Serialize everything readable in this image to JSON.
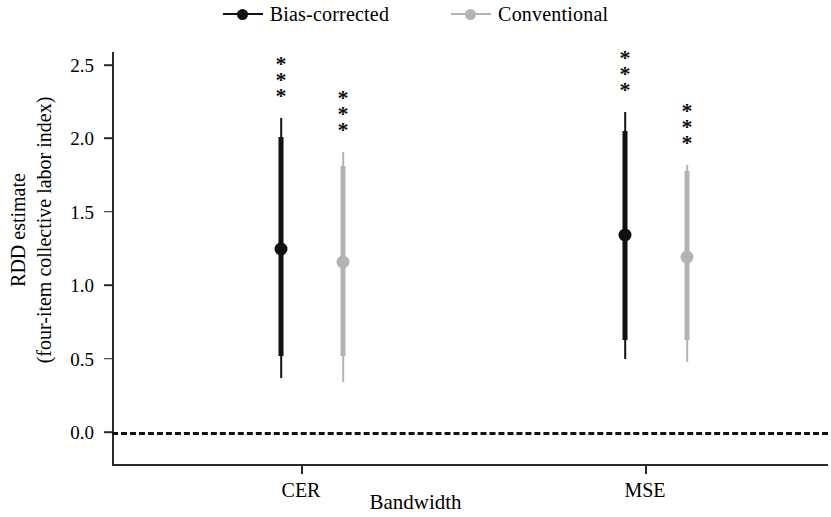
{
  "chart_data": {
    "type": "scatter",
    "title": "",
    "xlabel": "Bandwidth",
    "ylabel_line1": "RDD estimate",
    "ylabel_line2": "(four-item collective labor index)",
    "categories": [
      "CER",
      "MSE"
    ],
    "ylim": [
      -0.22,
      2.72
    ],
    "yticks": [
      "0.0",
      "0.5",
      "1.0",
      "1.5",
      "2.0",
      "2.5"
    ],
    "ytick_values": [
      0.0,
      0.5,
      1.0,
      1.5,
      2.0,
      2.5
    ],
    "grid": false,
    "legend_position": "top-center",
    "reference_line": {
      "value": 0.0,
      "style": "dashed",
      "color": "#111111"
    },
    "series": [
      {
        "name": "Bias-corrected",
        "color": "#111111",
        "points": [
          {
            "category": "CER",
            "estimate": 1.25,
            "ci_inner_low": 0.52,
            "ci_inner_high": 2.01,
            "ci_outer_low": 0.37,
            "ci_outer_high": 2.14,
            "significance": "***"
          },
          {
            "category": "MSE",
            "estimate": 1.34,
            "ci_inner_low": 0.63,
            "ci_inner_high": 2.05,
            "ci_outer_low": 0.5,
            "ci_outer_high": 2.18,
            "significance": "***"
          }
        ]
      },
      {
        "name": "Conventional",
        "color": "#b3b3b3",
        "points": [
          {
            "category": "CER",
            "estimate": 1.16,
            "ci_inner_low": 0.52,
            "ci_inner_high": 1.81,
            "ci_outer_low": 0.34,
            "ci_outer_high": 1.91,
            "significance": "***"
          },
          {
            "category": "MSE",
            "estimate": 1.19,
            "ci_inner_low": 0.63,
            "ci_inner_high": 1.78,
            "ci_outer_low": 0.48,
            "ci_outer_high": 1.82,
            "significance": "***"
          }
        ]
      }
    ]
  },
  "legend": {
    "entries": [
      {
        "label": "Bias-corrected",
        "color": "#111111"
      },
      {
        "label": "Conventional",
        "color": "#b3b3b3"
      }
    ]
  },
  "axes": {
    "y": {
      "label_line1": "RDD estimate",
      "label_line2": "(four-item collective labor index)",
      "ticks": [
        {
          "label": "2.5",
          "value": 2.5
        },
        {
          "label": "2.0",
          "value": 2.0
        },
        {
          "label": "1.5",
          "value": 1.5
        },
        {
          "label": "1.0",
          "value": 1.0
        },
        {
          "label": "0.5",
          "value": 0.5
        },
        {
          "label": "0.0",
          "value": 0.0
        }
      ]
    },
    "x": {
      "label": "Bandwidth",
      "ticks": [
        {
          "label": "CER",
          "value": 0
        },
        {
          "label": "MSE",
          "value": 1
        }
      ]
    }
  },
  "annotations": {
    "stars": [
      "*",
      "*",
      "*"
    ]
  }
}
